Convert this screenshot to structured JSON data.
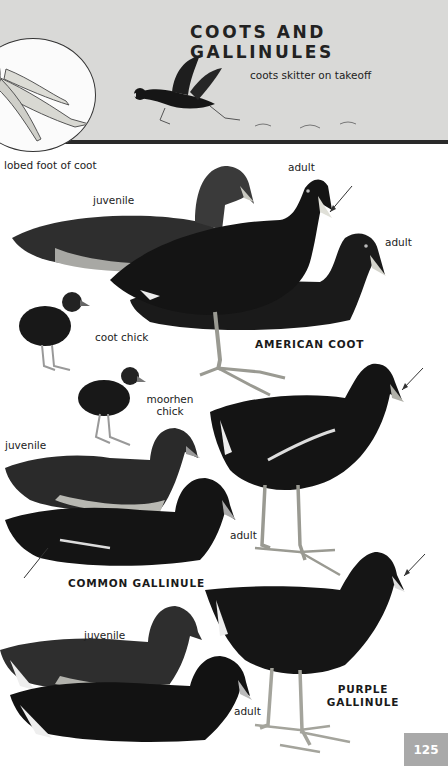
{
  "header": {
    "title": "COOTS AND GALLINULES",
    "takeoff_caption": "coots skitter on takeoff",
    "foot_caption": "lobed foot of coot"
  },
  "american_coot": {
    "name": "AMERICAN COOT",
    "labels": {
      "juvenile": "juvenile",
      "adult_standing": "adult",
      "adult_swimming": "adult",
      "chick": "coot chick"
    }
  },
  "common_gallinule": {
    "name": "COMMON GALLINULE",
    "labels": {
      "chick_line1": "moorhen",
      "chick_line2": "chick",
      "juvenile": "juvenile",
      "adult": "adult"
    }
  },
  "purple_gallinule": {
    "name_line1": "PURPLE",
    "name_line2": "GALLINULE",
    "labels": {
      "juvenile": "juvenile",
      "adult": "adult"
    }
  },
  "page": {
    "number": "125"
  },
  "colors": {
    "header_bg": "#d9d9d7",
    "page_tab": "#a9a9a9",
    "bird_dark": "#161616"
  }
}
